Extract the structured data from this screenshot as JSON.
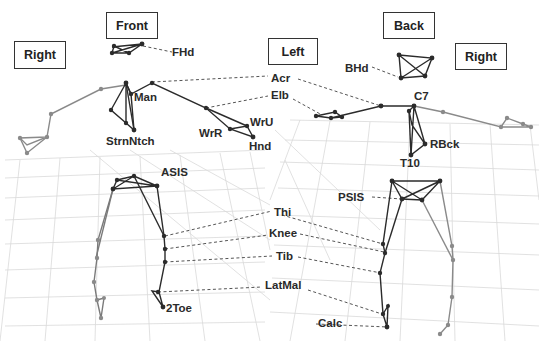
{
  "figure": {
    "views": {
      "front_view": {
        "title": "Front",
        "left_side": "Right",
        "right_side": "Left"
      },
      "back_view": {
        "title": "Back",
        "left_side": "Left",
        "right_side": "Right"
      }
    },
    "markers": {
      "FHd": "FHd",
      "BHd": "BHd",
      "Acr": "Acr",
      "Elb": "Elb",
      "Man": "Man",
      "StrnNtch": "StrnNtch",
      "WrR": "WrR",
      "WrU": "WrU",
      "Hnd": "Hnd",
      "C7": "C7",
      "RBck": "RBck",
      "T10": "T10",
      "ASIS": "ASIS",
      "PSIS": "PSIS",
      "Thi": "Thi",
      "Knee": "Knee",
      "Tib": "Tib",
      "LatMal": "LatMal",
      "2Toe": "2Toe",
      "Calc": "Calc"
    },
    "colors": {
      "dark_segment": "#2b2b2b",
      "light_segment": "#8a8a8a",
      "grid": "#d6d6d6",
      "leader_line": "#555555"
    }
  }
}
